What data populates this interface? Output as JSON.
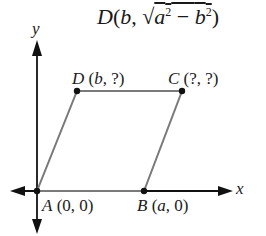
{
  "formula": {
    "text": "D(b, √(a² − b²))",
    "point": "D",
    "x": "b",
    "y_expr": "√(a² − b²)"
  },
  "axes": {
    "x_label": "x",
    "y_label": "y"
  },
  "points": [
    {
      "name": "A",
      "coords": "(0, 0)"
    },
    {
      "name": "B",
      "coords": "(a, 0)"
    },
    {
      "name": "C",
      "coords": "(?, ?)"
    },
    {
      "name": "D",
      "coords": "(b, ?)"
    }
  ],
  "colors": {
    "axis": "#111111",
    "edge": "#7a7a7a",
    "point": "#111111"
  }
}
